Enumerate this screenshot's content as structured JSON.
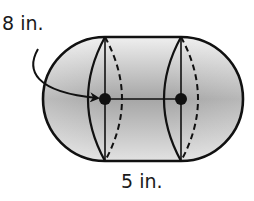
{
  "diagram": {
    "type": "capsule-solid",
    "labels": {
      "diameter": "8 in.",
      "length": "5 in."
    },
    "colors": {
      "stroke": "#111111",
      "fill_light": "#ececec",
      "fill_dark": "#a6a6a6",
      "text": "#1a1a1a"
    },
    "geometry": {
      "left_center": [
        105,
        99
      ],
      "right_center": [
        181,
        99
      ],
      "radius": 62
    }
  }
}
